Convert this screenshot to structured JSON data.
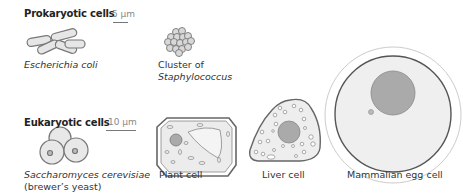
{
  "prokaryotic": {
    "heading": "Prokaryotic cells",
    "scale": "5 µm",
    "cells": [
      {
        "caption_line1": "Escherichia coli",
        "caption_line2": ""
      },
      {
        "caption_line1": "Cluster of",
        "caption_line2": "Staphylococcus"
      }
    ]
  },
  "eukaryotic": {
    "heading": "Eukaryotic cells",
    "scale": "10 µm",
    "cells": [
      {
        "caption_line1": "Saccharomyces cerevisiae",
        "caption_line2": "(brewer’s yeast)"
      },
      {
        "caption_line1": "Plant cell"
      },
      {
        "caption_line1": "Liver cell"
      },
      {
        "caption_line1": "Mammalian egg cell"
      }
    ]
  },
  "colors": {
    "outline": "#666666",
    "cytoplasm": "#eeeeee",
    "nucleus": "#aaaaaa"
  }
}
